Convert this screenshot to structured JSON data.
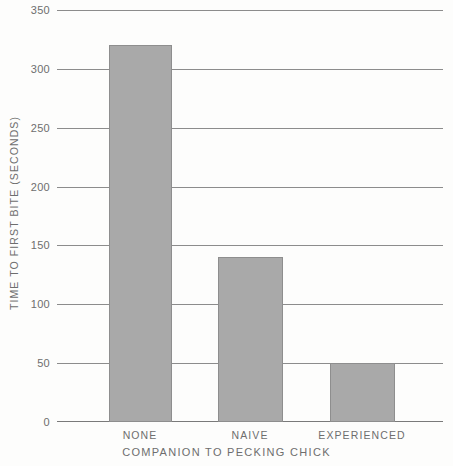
{
  "chart_data": {
    "type": "bar",
    "title": "",
    "subtitle": "",
    "categories": [
      "NONE",
      "NAIVE",
      "EXPERIENCED"
    ],
    "values": [
      320,
      140,
      50
    ],
    "xlabel": "COMPANION TO PECKING CHICK",
    "ylabel": "TIME TO FIRST BITE (SECONDS)",
    "ylim": [
      0,
      350
    ],
    "xlim": null,
    "yticks": [
      0,
      50,
      100,
      150,
      200,
      250,
      300,
      350
    ],
    "ytick_labels": [
      "0",
      "50",
      "100",
      "150",
      "200",
      "250",
      "300",
      "350"
    ],
    "grid": true,
    "grid_axis": "y",
    "legend": null,
    "legend_position": "none",
    "annotations": [],
    "bar_fill_color": "#a9a9a9",
    "bar_edge_color": "#8e8e8e",
    "gridline_color": "#8c8c8c",
    "axis_color": "#7a7a7a",
    "text_color": "#6e6e6e",
    "background_color": "#fdfdfc"
  }
}
